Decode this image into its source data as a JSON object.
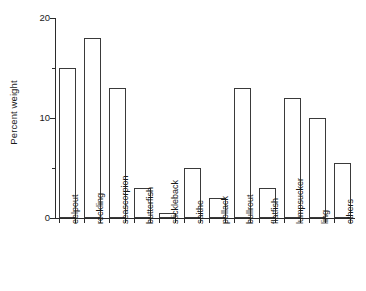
{
  "chart_data": {
    "type": "bar",
    "title": "",
    "subtitle": "",
    "xlabel": "",
    "ylabel": "Percent weight",
    "categories": [
      "eelpout",
      "rockling",
      "seascorpion",
      "butterfish",
      "stickleback",
      "saithe",
      "pollack",
      "bullrout",
      "flatfish",
      "lumpsucker",
      "ling",
      "others"
    ],
    "values": [
      15,
      18,
      13,
      3,
      0.5,
      5,
      2,
      13,
      3,
      12,
      10,
      5.5
    ],
    "ylim": [
      0,
      20
    ],
    "y_major_ticks": [
      0,
      10,
      20
    ],
    "y_minor_ticks": [
      5,
      15
    ],
    "y_tick_labels": [
      "0",
      "10",
      "20"
    ],
    "grid": false,
    "legend": false,
    "legend_position": "none",
    "bar_fill": "#ffffff",
    "bar_edge": "#3a3a3a",
    "axis_color": "#2b2b2b",
    "background": "#ffffff",
    "xtick_label_rotation": 90
  },
  "axis": {
    "y_title": "Percent weight"
  }
}
